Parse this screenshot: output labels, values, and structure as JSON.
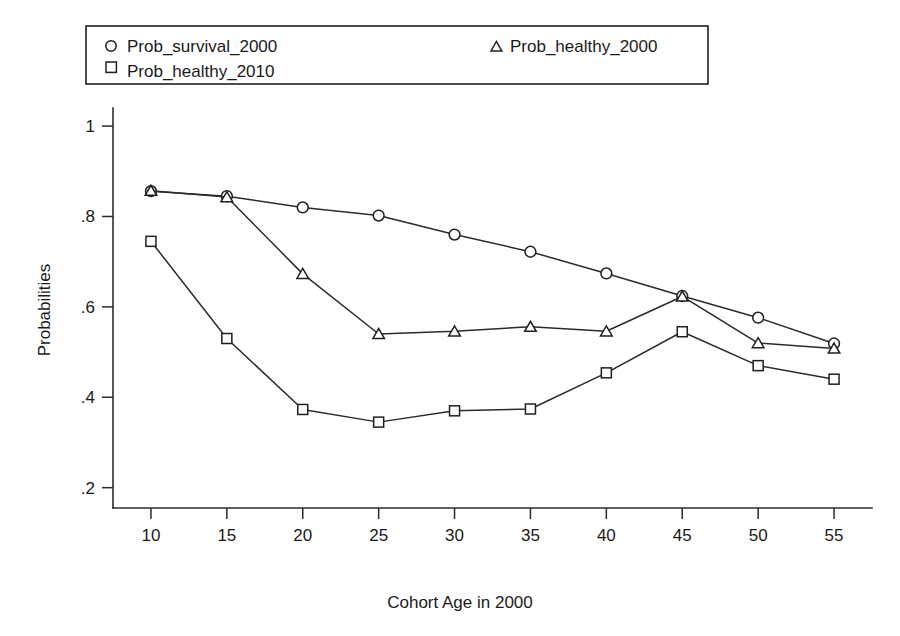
{
  "chart_data": {
    "type": "line",
    "title": "",
    "subtitle": "",
    "xlabel": "Cohort Age in 2000",
    "ylabel": "Probabilities",
    "x": [
      10,
      15,
      20,
      25,
      30,
      35,
      40,
      45,
      50,
      55
    ],
    "xtick_labels": [
      "10",
      "15",
      "20",
      "25",
      "30",
      "35",
      "40",
      "45",
      "50",
      "55"
    ],
    "ytick_labels": [
      ".2",
      ".4",
      ".6",
      ".8",
      "1"
    ],
    "ytick_values": [
      0.2,
      0.4,
      0.6,
      0.8,
      1.0
    ],
    "xlim": [
      7.5,
      57.5
    ],
    "ylim": [
      0.155,
      1.04
    ],
    "grid": false,
    "legend_position": "top",
    "series": [
      {
        "name": "Prob_survival_2000",
        "marker": "circle",
        "values": [
          0.856,
          0.845,
          0.82,
          0.802,
          0.76,
          0.722,
          0.674,
          0.624,
          0.576,
          0.519
        ]
      },
      {
        "name": "Prob_healthy_2000",
        "marker": "triangle",
        "values": [
          0.857,
          0.843,
          0.673,
          0.54,
          0.546,
          0.556,
          0.546,
          0.623,
          0.52,
          0.508
        ]
      },
      {
        "name": "Prob_healthy_2010",
        "marker": "square",
        "values": [
          0.745,
          0.53,
          0.373,
          0.345,
          0.37,
          0.374,
          0.454,
          0.545,
          0.47,
          0.44
        ]
      }
    ]
  },
  "legend": {
    "entries": [
      {
        "label": "Prob_survival_2000",
        "marker": "circle-icon"
      },
      {
        "label": "Prob_healthy_2000",
        "marker": "triangle-icon"
      },
      {
        "label": "Prob_healthy_2010",
        "marker": "square-icon"
      }
    ]
  },
  "colors": {
    "ink": "#1f1f1f",
    "axis": "#2b2b2b",
    "background": "#ffffff",
    "marker_fill": "#ffffff"
  }
}
